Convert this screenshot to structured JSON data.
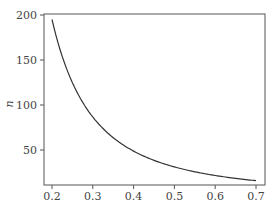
{
  "chart_data": {
    "type": "line",
    "title": "",
    "xlabel": "",
    "ylabel": "n",
    "xlim": [
      0.18,
      0.72
    ],
    "ylim": [
      11,
      200
    ],
    "x_ticks": [
      0.2,
      0.3,
      0.4,
      0.5,
      0.6,
      0.7
    ],
    "x_tick_labels": [
      "0.2",
      "0.3",
      "0.4",
      "0.5",
      "0.6",
      "0.7"
    ],
    "y_ticks": [
      50,
      100,
      150,
      200
    ],
    "y_tick_labels": [
      "50",
      "100",
      "150",
      "200"
    ],
    "grid": false,
    "legend": null,
    "series": [
      {
        "name": "n",
        "color": "#333333",
        "x": [
          0.2,
          0.22,
          0.25,
          0.28,
          0.3,
          0.35,
          0.4,
          0.45,
          0.5,
          0.55,
          0.6,
          0.65,
          0.7
        ],
        "values": [
          195,
          161,
          125,
          100,
          87,
          64,
          49,
          39,
          31,
          26,
          22,
          18.5,
          16
        ]
      }
    ]
  }
}
